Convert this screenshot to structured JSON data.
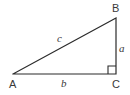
{
  "figure": {
    "type": "right-triangle-diagram",
    "background_color": "#ffffff",
    "stroke_color": "#2b2b2b",
    "label_color": "#3a3a3a",
    "stroke_width": 1.2,
    "vertices": {
      "a": {
        "label": "A",
        "x": 13,
        "y": 74
      },
      "b": {
        "label": "B",
        "x": 116,
        "y": 18
      },
      "c": {
        "label": "C",
        "x": 116,
        "y": 74
      }
    },
    "sides": {
      "a": {
        "label": "a",
        "from": "B",
        "to": "C",
        "description": "vertical leg"
      },
      "b": {
        "label": "b",
        "from": "A",
        "to": "C",
        "description": "horizontal base leg"
      },
      "c": {
        "label": "c",
        "from": "A",
        "to": "B",
        "description": "hypotenuse"
      }
    },
    "right_angle": {
      "at_vertex": "C",
      "marker": "square",
      "size": 8
    }
  }
}
